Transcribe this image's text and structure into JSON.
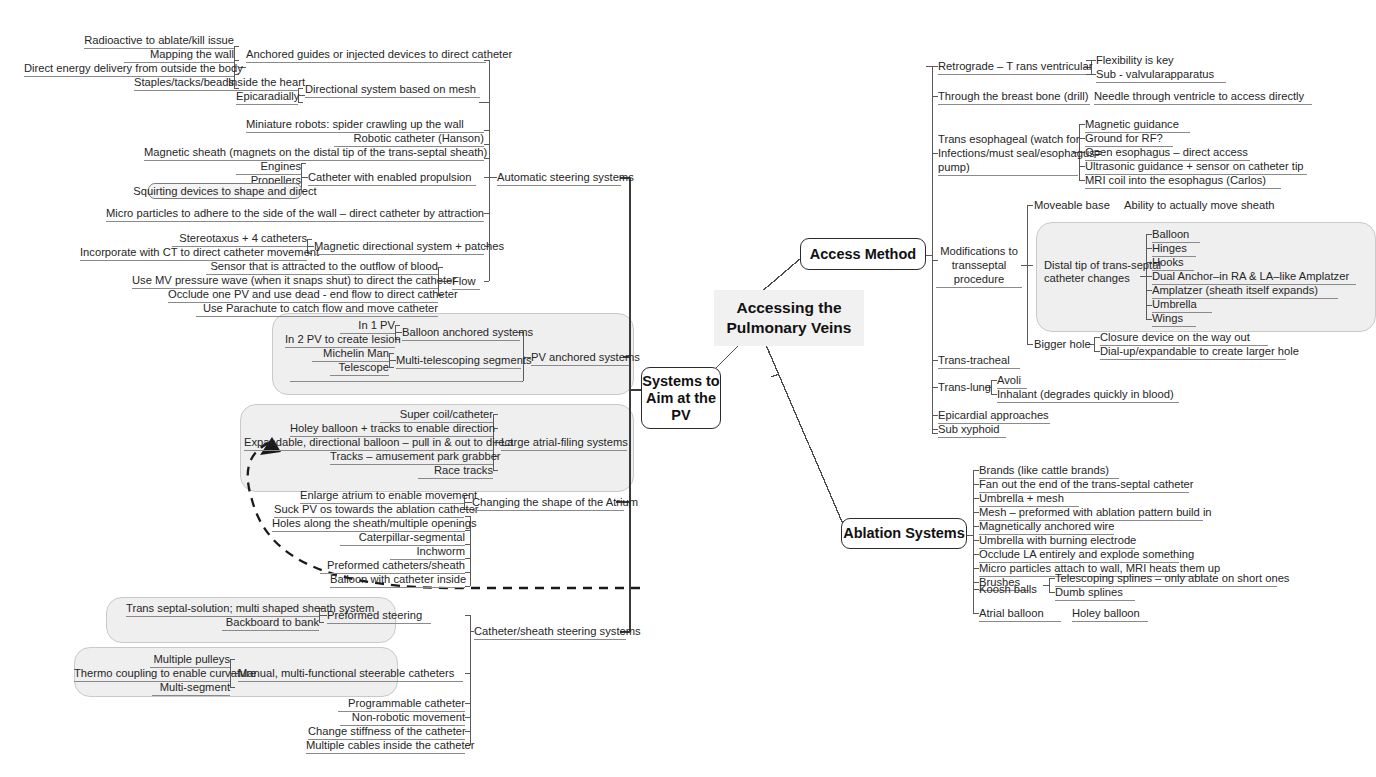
{
  "root": {
    "label": "Accessing the\nPulmonary Veins"
  },
  "branches": {
    "access_method": {
      "label": "Access Method"
    },
    "systems_to_aim": {
      "label": "Systems to\nAim at the\nPV"
    },
    "ablation_systems": {
      "label": "Ablation Systems"
    }
  },
  "left": {
    "automatic_steering": {
      "label": "Automatic steering systems",
      "children": [
        {
          "label": "Anchored guides or injected devices to direct catheter",
          "leaves": [
            "Radioactive to ablate/kill issue",
            "Mapping the wall",
            "Direct energy delivery from outside the body",
            "Staples/tacks/beads"
          ]
        },
        {
          "label": "Directional system based on mesh",
          "leaves": [
            "Inside the heart",
            "Epicaradially"
          ]
        },
        {
          "label": "Miniature robots:  spider crawling up the wall",
          "leaves": []
        },
        {
          "label": "Robotic catheter (Hanson)",
          "leaves": []
        },
        {
          "label": "Magnetic sheath (magnets on the distal tip of the trans-septal sheath)",
          "leaves": []
        },
        {
          "label": "Catheter with enabled propulsion",
          "leaves": [
            "Engines",
            "Propellers",
            "Squirting devices to shape and direct"
          ]
        },
        {
          "label": "Micro particles to adhere to the side of the wall – direct catheter by attraction",
          "leaves": []
        },
        {
          "label": "Magnetic directional system + patches",
          "leaves": [
            "Stereotaxus + 4 catheters",
            "Incorporate with CT to direct catheter movement"
          ]
        },
        {
          "label": "Flow",
          "leaves": [
            "Sensor that is attracted to the outflow of blood",
            "Use MV pressure wave (when it snaps shut) to direct the catheter",
            "Occlude one PV and use dead - end flow to direct catheter",
            "Use Parachute to catch flow and move catheter"
          ]
        }
      ]
    },
    "pv_anchored": {
      "label": "PV anchored systems",
      "children": [
        {
          "label": "Balloon anchored systems",
          "leaves": [
            "In 1 PV",
            "In 2 PV to create lesion"
          ]
        },
        {
          "label": "Multi-telescoping segments",
          "leaves": [
            "Michelin Man",
            "Telescope"
          ]
        },
        {
          "label": "Balloons that change shape (pacifier shaped)",
          "leaves": []
        }
      ]
    },
    "large_atrial": {
      "label": "Large atrial-filing systems",
      "leaves": [
        "Super coil/catheter",
        "Holey balloon + tracks to enable direction",
        "Expandable, directional balloon – pull in & out to direct",
        "Tracks – amusement park grabber",
        "Race tracks"
      ]
    },
    "changing_shape": {
      "label": "Changing the shape of the Atrium",
      "leaves": [
        "Enlarge atrium to enable movement",
        "Suck PV os towards the ablation catheter",
        "Holes along the sheath/multiple openings",
        "Caterpillar-segmental",
        "Inchworm",
        "Preformed catheters/sheath",
        "Balloon with catheter inside"
      ]
    },
    "catheter_sheath_steering": {
      "label": "Catheter/sheath steering systems",
      "children": [
        {
          "label": "Preformed steering",
          "leaves": [
            "Trans septal-solution;  multi shaped sheath system",
            "Backboard to bank"
          ]
        },
        {
          "label": "Manual, multi-functional steerable catheters",
          "leaves": [
            "Multiple pulleys",
            "Thermo coupling to enable curvature",
            "Multi-segment"
          ]
        },
        {
          "label": "Programmable catheter",
          "leaves": []
        },
        {
          "label": "Non-robotic movement",
          "leaves": []
        },
        {
          "label": "Change stiffness of the catheter",
          "leaves": []
        },
        {
          "label": "Multiple cables inside the catheter",
          "leaves": []
        }
      ]
    }
  },
  "right": {
    "access_method_children": [
      {
        "label": "Retrograde – T rans ventricular",
        "leaves": [
          "Flexibility is key",
          "Sub - valvularapparatus"
        ]
      },
      {
        "label": "Through the breast bone (drill)",
        "leaves": [
          "Needle through ventricle to access directly"
        ]
      },
      {
        "label": "Trans esophageal (watch for Infections/must seal/esophagus= pump)",
        "label_lines": [
          "Trans esophageal (watch for",
          "Infections/must seal/esophagus=",
          "pump)"
        ],
        "leaves": [
          "Magnetic guidance",
          "Ground for RF?",
          "Open esophagus – direct access",
          "Ultrasonic guidance + sensor on catheter tip",
          "MRI coil into the esophagus (Carlos)"
        ]
      },
      {
        "label": "Modifications to transseptal procedure",
        "label_lines": [
          "Modifications to",
          "transseptal",
          "procedure"
        ],
        "children": [
          {
            "label": "Moveable base",
            "leaves": [
              "Ability to actually move sheath"
            ]
          },
          {
            "label": "Distal tip of trans-septal catheter changes",
            "label_lines": [
              "Distal tip of trans-septal",
              "catheter changes"
            ],
            "leaves": [
              "Balloon",
              "Hinges",
              "Hooks",
              " Dual Anchor–in RA & LA–like Amplatzer",
              "Amplatzer (sheath itself   expands)",
              "Umbrella",
              "Wings"
            ]
          },
          {
            "label": "Bigger hole",
            "leaves": [
              "Closure device on the way out",
              "Dial-up/expandable to create larger hole"
            ]
          }
        ]
      },
      {
        "label": "Trans-tracheal",
        "leaves": []
      },
      {
        "label": "Trans-lung",
        "leaves": [
          "Avoli",
          "Inhalant (degrades quickly in blood)"
        ]
      },
      {
        "label": "Epicardial approaches",
        "leaves": []
      },
      {
        "label": "Sub xyphoid",
        "leaves": []
      }
    ],
    "ablation_children": [
      {
        "label": "Brands (like cattle brands)",
        "leaves": []
      },
      {
        "label": "Fan out the end of the trans-septal catheter",
        "leaves": []
      },
      {
        "label": "Umbrella + mesh",
        "leaves": []
      },
      {
        "label": "Mesh – preformed with ablation pattern build in",
        "leaves": []
      },
      {
        "label": "Magnetically anchored wire",
        "leaves": []
      },
      {
        "label": "Umbrella with burning electrode",
        "leaves": []
      },
      {
        "label": "Occlude LA entirely and explode something",
        "leaves": []
      },
      {
        "label": "Micro particles attach to wall, MRI heats them up",
        "leaves": []
      },
      {
        "label": "Brushes",
        "leaves": []
      },
      {
        "label": "Koosh balls",
        "leaves": [
          "Telescoping splines – only ablate on short ones",
          "Dumb splines"
        ]
      },
      {
        "label": "Atrial balloon",
        "leaves": [
          "Holey balloon"
        ]
      }
    ]
  },
  "colors": {
    "line": "#5a5a5a",
    "node_border": "#2b2b2b",
    "group_fill": "#efefef",
    "root_fill": "#f1f1f1",
    "text": "#262626"
  }
}
